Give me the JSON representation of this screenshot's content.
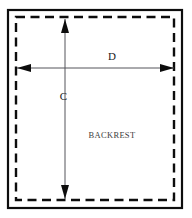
{
  "diagram": {
    "part_label": "BACKREST",
    "dimensions": [
      {
        "id": "C",
        "label": "C",
        "orientation": "vertical",
        "arrow": "double-headed"
      },
      {
        "id": "D",
        "label": "D",
        "orientation": "horizontal",
        "arrow": "double-headed"
      }
    ],
    "colors": {
      "background": "#ffffff",
      "outline": "#0d0d0d",
      "dimension_line": "#55555a",
      "part_text": "#3c3c3c",
      "dimension_text": "#1a1a1a"
    },
    "geometry": {
      "outer_frame": {
        "x": 8,
        "y": 10,
        "width": 174,
        "height": 198
      },
      "inner_dashed": {
        "x": 16,
        "y": 17,
        "width": 158,
        "height": 183
      },
      "vertical_arrow": {
        "x": 65,
        "y_top": 19,
        "y_bottom": 199
      },
      "horizontal_arrow": {
        "y": 68,
        "x_left": 17,
        "x_right": 174
      },
      "label_c": {
        "x": 67,
        "y": 100
      },
      "label_d": {
        "x": 112,
        "y": 60
      },
      "label_backrest": {
        "x": 112,
        "y": 138
      }
    }
  }
}
